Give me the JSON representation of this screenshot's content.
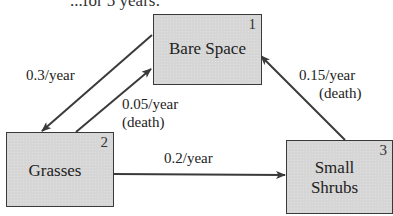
{
  "diagram": {
    "header_fragment": "...for 5 years:",
    "nodes": [
      {
        "id": 1,
        "number": "1",
        "label": "Bare Space"
      },
      {
        "id": 2,
        "number": "2",
        "label": "Grasses"
      },
      {
        "id": 3,
        "number": "3",
        "label_line1": "Small",
        "label_line2": "Shrubs"
      }
    ],
    "edges": [
      {
        "from": 1,
        "to": 2,
        "rate": "0.3/year"
      },
      {
        "from": 2,
        "to": 1,
        "rate": "0.05/year",
        "note": "(death)"
      },
      {
        "from": 2,
        "to": 3,
        "rate": "0.2/year"
      },
      {
        "from": 3,
        "to": 1,
        "rate": "0.15/year",
        "note": "(death)"
      }
    ],
    "colors": {
      "box_fill": "#d6d6d6",
      "stroke": "#3a3a3a"
    }
  }
}
